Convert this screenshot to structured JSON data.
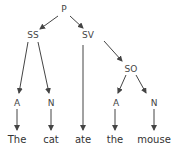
{
  "diagram": {
    "type": "parse-tree",
    "nodes": [
      {
        "id": "P",
        "label": "P",
        "x": 64,
        "y": 12
      },
      {
        "id": "SS",
        "label": "SS",
        "x": 33,
        "y": 37
      },
      {
        "id": "SV",
        "label": "SV",
        "x": 88,
        "y": 37
      },
      {
        "id": "SO",
        "label": "SO",
        "x": 131,
        "y": 71
      },
      {
        "id": "A1",
        "label": "A",
        "x": 17,
        "y": 105
      },
      {
        "id": "N1",
        "label": "N",
        "x": 51,
        "y": 105
      },
      {
        "id": "A2",
        "label": "A",
        "x": 116,
        "y": 105
      },
      {
        "id": "N2",
        "label": "N",
        "x": 154,
        "y": 105
      }
    ],
    "words": [
      {
        "id": "w1",
        "label": "The",
        "x": 17,
        "y": 141
      },
      {
        "id": "w2",
        "label": "cat",
        "x": 51,
        "y": 141
      },
      {
        "id": "w3",
        "label": "ate",
        "x": 83,
        "y": 141
      },
      {
        "id": "w4",
        "label": "the",
        "x": 115,
        "y": 141
      },
      {
        "id": "w5",
        "label": "mouse",
        "x": 154,
        "y": 141
      }
    ],
    "edges": [
      {
        "from": "P",
        "to": "SS"
      },
      {
        "from": "P",
        "to": "SV"
      },
      {
        "from": "SS",
        "to": "A1"
      },
      {
        "from": "SS",
        "to": "N1"
      },
      {
        "from": "SV",
        "to": "w3"
      },
      {
        "from": "SV",
        "to": "SO"
      },
      {
        "from": "SO",
        "to": "A2"
      },
      {
        "from": "SO",
        "to": "N2"
      },
      {
        "from": "A1",
        "to": "w1"
      },
      {
        "from": "N1",
        "to": "w2"
      },
      {
        "from": "A2",
        "to": "w4"
      },
      {
        "from": "N2",
        "to": "w5"
      }
    ],
    "colors": {
      "line": "#444444",
      "text": "#333333",
      "background": "#ffffff"
    }
  }
}
